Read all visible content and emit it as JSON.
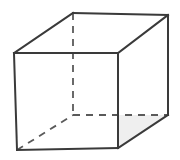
{
  "figure": {
    "canvas": {
      "width": 180,
      "height": 160,
      "background": "#ffffff"
    },
    "style": {
      "edge_color": "#3a3a3a",
      "hidden_edge_color": "#5a5a5a",
      "edge_width": 2,
      "hidden_edge_width": 1.8,
      "hidden_dash_pattern": "7 6",
      "floor_fill": "#efefef",
      "face_fill": "#ffffff"
    },
    "vertices": {
      "front_top_left": {
        "label": "front-top-left",
        "x": 14,
        "y": 53
      },
      "front_top_right": {
        "label": "front-top-right",
        "x": 118,
        "y": 53
      },
      "front_bottom_right": {
        "label": "front-bottom-right",
        "x": 118,
        "y": 148
      },
      "front_bottom_left": {
        "label": "front-bottom-left",
        "x": 17,
        "y": 150
      },
      "back_top_left": {
        "label": "back-top-left",
        "x": 73,
        "y": 13
      },
      "back_top_right": {
        "label": "back-top-right",
        "x": 168,
        "y": 15
      },
      "back_bottom_right": {
        "label": "back-bottom-right",
        "x": 168,
        "y": 115
      },
      "back_bottom_left": {
        "label": "back-bottom-left",
        "x": 73,
        "y": 115
      }
    },
    "polygons": {
      "front_face": "14,53 118,53 118,148 17,150",
      "top_face": "14,53 73,13 168,15 118,53",
      "right_face": "118,53 168,15 168,115 118,148",
      "floor_face": "17,150 73,115 168,115 118,148"
    },
    "visible_edges": [
      {
        "name": "front-top-edge",
        "path": "M14,53 L118,53"
      },
      {
        "name": "front-left-edge",
        "path": "M14,53 L17,150"
      },
      {
        "name": "front-right-edge",
        "path": "M118,53 L118,148"
      },
      {
        "name": "front-bottom-edge",
        "path": "M17,150 L118,148"
      },
      {
        "name": "top-left-diagonal-edge",
        "path": "M14,53 L73,13"
      },
      {
        "name": "top-back-edge",
        "path": "M73,13 L168,15"
      },
      {
        "name": "top-right-diagonal-edge",
        "path": "M118,53 L168,15"
      },
      {
        "name": "back-right-vertical-edge",
        "path": "M168,15 L168,115"
      },
      {
        "name": "bottom-right-diagonal-edge",
        "path": "M118,148 L168,115"
      }
    ],
    "hidden_edges": [
      {
        "name": "back-left-vertical-edge",
        "path": "M73,13 L73,115"
      },
      {
        "name": "bottom-back-edge",
        "path": "M73,115 L168,115"
      },
      {
        "name": "bottom-left-diagonal-edge",
        "path": "M17,150 L73,115"
      }
    ]
  }
}
